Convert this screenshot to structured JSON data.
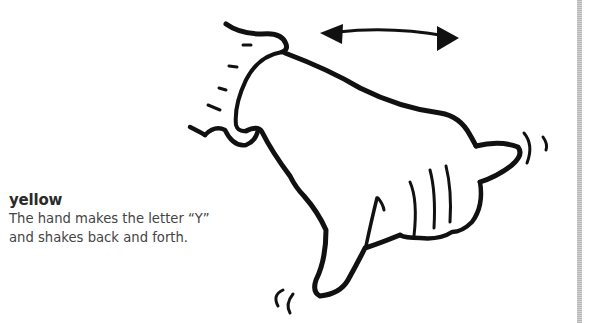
{
  "entry": {
    "word": "yellow",
    "description_line1": "The hand makes the letter “Y”",
    "description_line2": "and shakes back and forth."
  },
  "illustration": {
    "subject": "hand-y-sign-shaking",
    "motion_indicator": "double-headed-arrow",
    "stroke_color": "#111111"
  },
  "page": {
    "margin_rule_color": "#c4c4c4"
  }
}
